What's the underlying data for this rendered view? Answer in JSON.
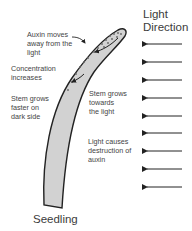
{
  "diagram": {
    "title": "Light\nDirection",
    "caption": "Seedling",
    "labels": [
      {
        "id": "auxin-moves",
        "text": "Auxin moves\naway from the\nlight"
      },
      {
        "id": "concentration",
        "text": "Concentration\nincreases"
      },
      {
        "id": "grows-faster",
        "text": "Stem grows\nfaster on\ndark side"
      },
      {
        "id": "grows-towards",
        "text": "Stem grows\ntowards\nthe light"
      },
      {
        "id": "light-destroys",
        "text": "Light causes\ndestruction of\nauxin"
      }
    ],
    "light_arrows": {
      "count": 9,
      "direction": "left"
    },
    "colors": {
      "stem_fill": "#d2d2d2",
      "stem_outline": "#222222",
      "arrow": "#222222",
      "text": "#444444"
    }
  }
}
